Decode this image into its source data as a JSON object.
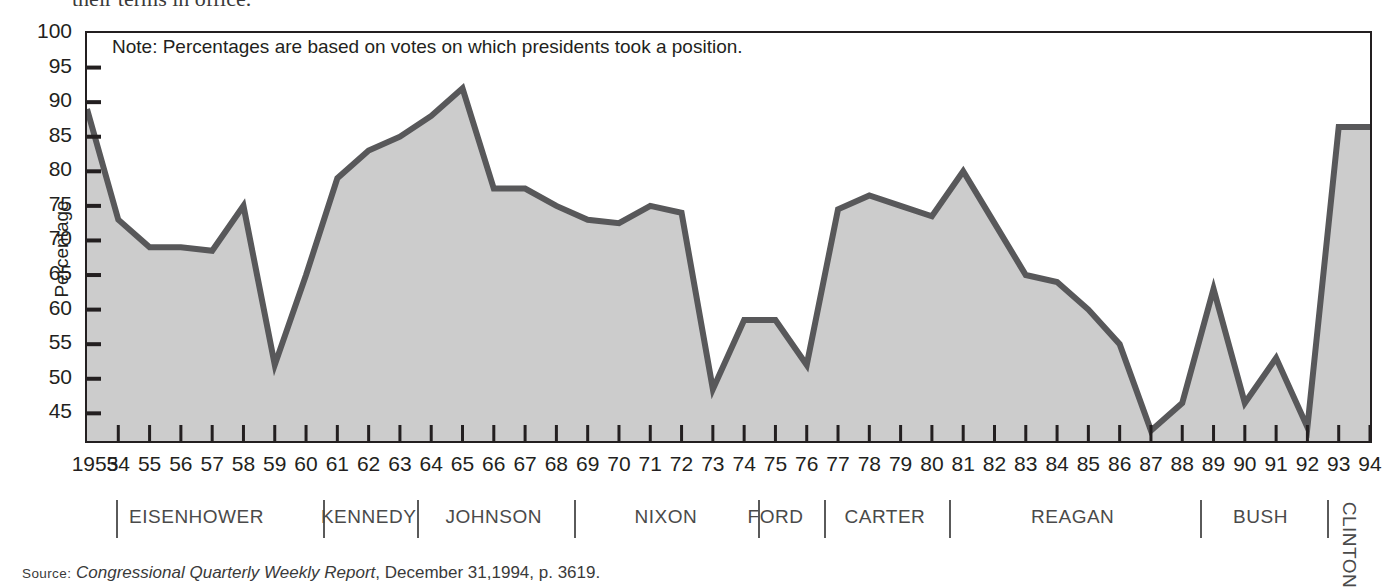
{
  "page": {
    "clipped_heading_fragment": "their terms in office."
  },
  "chart_data": {
    "type": "area",
    "title": "",
    "subtitle": "",
    "note": "Note: Percentages are based on votes on which presidents took a position.",
    "xlabel": "",
    "ylabel": "Percentage",
    "ylim": [
      41,
      100
    ],
    "xlim": [
      1953,
      1994
    ],
    "grid": false,
    "legend_position": "none",
    "yticks": [
      45,
      50,
      55,
      60,
      65,
      70,
      75,
      80,
      85,
      90,
      95,
      100
    ],
    "ytick_labels": [
      "45",
      "50",
      "55",
      "60",
      "65",
      "70",
      "75",
      "80",
      "85",
      "90",
      "95",
      "100"
    ],
    "x": [
      1953,
      1954,
      1955,
      1956,
      1957,
      1958,
      1959,
      1960,
      1961,
      1962,
      1963,
      1964,
      1965,
      1966,
      1967,
      1968,
      1969,
      1970,
      1971,
      1972,
      1973,
      1974,
      1975,
      1976,
      1977,
      1978,
      1979,
      1980,
      1981,
      1982,
      1983,
      1984,
      1985,
      1986,
      1987,
      1988,
      1989,
      1990,
      1991,
      1992,
      1993,
      1994
    ],
    "xtick_labels": [
      "1953",
      "54",
      "55",
      "56",
      "57",
      "58",
      "59",
      "60",
      "61",
      "62",
      "63",
      "64",
      "65",
      "66",
      "67",
      "68",
      "69",
      "70",
      "71",
      "72",
      "73",
      "74",
      "75",
      "76",
      "77",
      "78",
      "79",
      "80",
      "81",
      "82",
      "83",
      "84",
      "85",
      "86",
      "87",
      "88",
      "89",
      "90",
      "91",
      "92",
      "93",
      "94"
    ],
    "values": [
      89.0,
      73.0,
      69.0,
      69.0,
      68.5,
      75.0,
      52.0,
      65.0,
      79.0,
      83.0,
      85.0,
      88.0,
      92.0,
      77.5,
      77.5,
      75.0,
      73.0,
      72.5,
      75.0,
      74.0,
      48.5,
      58.5,
      58.5,
      52.0,
      74.5,
      76.5,
      75.0,
      73.5,
      80.0,
      72.5,
      65.0,
      64.0,
      60.0,
      55.0,
      42.5,
      46.5,
      63.0,
      46.5,
      53.0,
      43.0,
      86.4,
      86.4
    ],
    "series_name": "Presidential success rate on congressional votes",
    "line_color": "#58585a",
    "fill_color": "#cccccc",
    "axis_color": "#231f20"
  },
  "presidents": [
    {
      "name": "EISENHOWER",
      "start_year": 1953,
      "end_year": 1960,
      "vertical": false
    },
    {
      "name": "KENNEDY",
      "start_year": 1961,
      "end_year": 1963,
      "vertical": false
    },
    {
      "name": "JOHNSON",
      "start_year": 1964,
      "end_year": 1968,
      "vertical": false
    },
    {
      "name": "NIXON",
      "start_year": 1969,
      "end_year": 1974,
      "vertical": false
    },
    {
      "name": "FORD",
      "start_year": 1974,
      "end_year": 1976,
      "vertical": false
    },
    {
      "name": "CARTER",
      "start_year": 1977,
      "end_year": 1980,
      "vertical": false
    },
    {
      "name": "REAGAN",
      "start_year": 1981,
      "end_year": 1988,
      "vertical": false
    },
    {
      "name": "BUSH",
      "start_year": 1989,
      "end_year": 1992,
      "vertical": false
    },
    {
      "name": "CLINTON",
      "start_year": 1993,
      "end_year": 1994,
      "vertical": true
    }
  ],
  "source": {
    "prefix": "Source:",
    "publication": "Congressional Quarterly Weekly Report",
    "rest": ", December 31,1994, p. 3619."
  }
}
